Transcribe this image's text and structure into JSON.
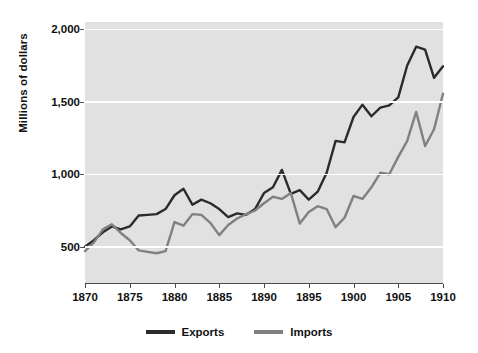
{
  "chart_data": {
    "type": "line",
    "title": "",
    "xlabel": "",
    "ylabel": "Millions of dollars",
    "xlim": [
      1870,
      1910
    ],
    "ylim": [
      250,
      2050
    ],
    "grid": true,
    "legend_position": "bottom",
    "xticks": [
      1870,
      1875,
      1880,
      1885,
      1890,
      1895,
      1900,
      1905,
      1910
    ],
    "xtick_labels": [
      "1870",
      "1875",
      "1880",
      "1885",
      "1890",
      "1895",
      "1900",
      "1905",
      "1910"
    ],
    "yticks": [
      500,
      1000,
      1500,
      2000
    ],
    "ytick_labels": [
      "500",
      "1,000",
      "1,500",
      "2,000"
    ],
    "x": [
      1870,
      1871,
      1872,
      1873,
      1874,
      1875,
      1876,
      1877,
      1878,
      1879,
      1880,
      1881,
      1882,
      1883,
      1884,
      1885,
      1886,
      1887,
      1888,
      1889,
      1890,
      1891,
      1892,
      1893,
      1894,
      1895,
      1896,
      1897,
      1898,
      1899,
      1900,
      1901,
      1902,
      1903,
      1904,
      1905,
      1906,
      1907,
      1908,
      1909,
      1910
    ],
    "series": [
      {
        "name": "Exports",
        "color": "#2b2b2b",
        "values": [
          500,
          545,
          600,
          640,
          620,
          640,
          715,
          720,
          725,
          760,
          855,
          900,
          790,
          825,
          800,
          760,
          705,
          730,
          720,
          760,
          870,
          910,
          1030,
          865,
          890,
          825,
          880,
          1010,
          1230,
          1220,
          1395,
          1480,
          1400,
          1460,
          1475,
          1530,
          1750,
          1880,
          1860,
          1665,
          1745
        ]
      },
      {
        "name": "Imports",
        "color": "#808080",
        "values": [
          470,
          530,
          620,
          655,
          595,
          545,
          475,
          465,
          455,
          470,
          670,
          645,
          725,
          720,
          665,
          580,
          650,
          695,
          725,
          750,
          800,
          845,
          830,
          870,
          660,
          740,
          780,
          760,
          635,
          700,
          850,
          830,
          910,
          1010,
          1000,
          1120,
          1230,
          1430,
          1195,
          1310,
          1555
        ]
      }
    ]
  },
  "axis": {
    "y_title": "Millions of dollars"
  },
  "legend": {
    "items": [
      {
        "label": "Exports",
        "color": "#2b2b2b"
      },
      {
        "label": "Imports",
        "color": "#808080"
      }
    ]
  }
}
